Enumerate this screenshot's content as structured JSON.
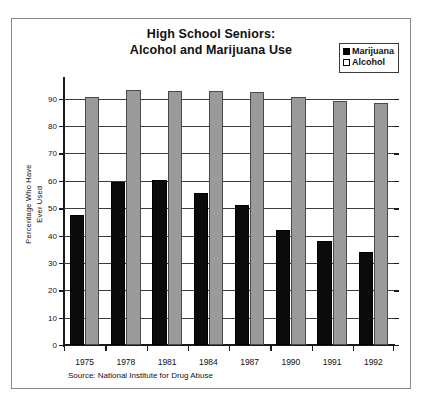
{
  "chart_data": {
    "type": "bar",
    "title": "High School Seniors: Alcohol and Marijuana Use",
    "title_lines": [
      "High School Seniors:",
      "Alcohol and Marijuana Use"
    ],
    "xlabel": "",
    "ylabel": "Percentage Who Have Ever Used",
    "ylabel_lines": [
      "Percentage Who Have",
      "Ever Used"
    ],
    "categories": [
      "1975",
      "1978",
      "1981",
      "1984",
      "1987",
      "1990",
      "1991",
      "1992"
    ],
    "series": [
      {
        "name": "Marijuana",
        "color": "#000000",
        "values": [
          47.5,
          59.5,
          60.3,
          55.5,
          51.0,
          42.0,
          38.0,
          34.0
        ]
      },
      {
        "name": "Alcohol",
        "color": "#9a9a9a",
        "values": [
          90.5,
          93.0,
          92.8,
          92.8,
          92.5,
          90.5,
          89.0,
          88.5
        ]
      }
    ],
    "ylim": [
      0,
      95
    ],
    "yticks": [
      0,
      10,
      20,
      30,
      40,
      50,
      60,
      70,
      80,
      90
    ],
    "ytick_labels": [
      "0",
      "10",
      "20",
      "30",
      "40",
      "50",
      "60",
      "70",
      "80",
      "90"
    ],
    "grid": true,
    "legend_position": "top-right",
    "annotations": [
      "Source: National Institute for Drug Abuse"
    ]
  },
  "legend": {
    "items": [
      {
        "label": "Marijuana",
        "swatch": "filled-black-square"
      },
      {
        "label": "Alcohol",
        "swatch": "empty-white-square"
      }
    ]
  },
  "source": {
    "text": "Source: National Institute for Drug Abuse"
  },
  "colors": {
    "marijuana": "#000000",
    "alcohol": "#9a9a9a",
    "axis": "#1a1a1a",
    "grid": "#3c3c3c",
    "frame": "#8a8a8a",
    "background": "#ffffff"
  }
}
